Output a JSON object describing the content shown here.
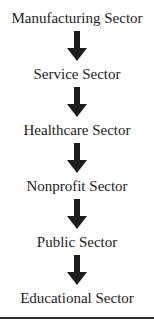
{
  "diagram": {
    "type": "flowchart",
    "direction": "top-down",
    "connector": "down-arrow",
    "nodes": [
      {
        "id": "manufacturing",
        "label": "Manufacturing Sector"
      },
      {
        "id": "service",
        "label": "Service Sector"
      },
      {
        "id": "healthcare",
        "label": "Healthcare Sector"
      },
      {
        "id": "nonprofit",
        "label": "Nonprofit Sector"
      },
      {
        "id": "public",
        "label": "Public Sector"
      },
      {
        "id": "educational",
        "label": "Educational Sector"
      }
    ],
    "colors": {
      "background": "#ffffff",
      "text": "#1c1c1c",
      "arrow": "#1c1c1c",
      "divider": "#2e2e2e"
    }
  }
}
